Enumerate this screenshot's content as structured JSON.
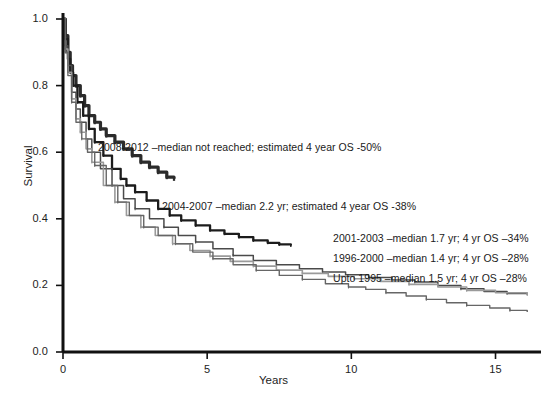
{
  "chart_data": {
    "type": "line",
    "title": "",
    "subtitle": "",
    "xlabel": "Years",
    "ylabel": "Survival",
    "xlim": [
      0,
      16.3
    ],
    "ylim": [
      0.0,
      1.0
    ],
    "xticks": [
      "0",
      "5",
      "10",
      "15"
    ],
    "xtick_values": [
      0,
      5,
      10,
      15
    ],
    "yticks": [
      "0.0",
      "0.2",
      "0.4",
      "0.6",
      "0.8",
      "1.0"
    ],
    "ytick_values": [
      0.0,
      0.2,
      0.4,
      0.6,
      0.8,
      1.0
    ],
    "grid": false,
    "legend_position": "inline-annotations",
    "series": [
      {
        "name": "2008-2012",
        "color": "#2b2b2b",
        "width": 3.2,
        "label": "2008-2012 –median not reached; estimated 4 year OS  -50%",
        "median_years": null,
        "four_year_os_percent": 50,
        "x": [
          0,
          0.08,
          0.17,
          0.25,
          0.33,
          0.45,
          0.6,
          0.75,
          0.9,
          1.1,
          1.3,
          1.5,
          1.8,
          2.1,
          2.4,
          2.7,
          3.0,
          3.3,
          3.6,
          3.85
        ],
        "y": [
          1.0,
          0.95,
          0.9,
          0.86,
          0.83,
          0.8,
          0.77,
          0.74,
          0.71,
          0.69,
          0.67,
          0.65,
          0.63,
          0.61,
          0.59,
          0.57,
          0.555,
          0.54,
          0.525,
          0.52
        ]
      },
      {
        "name": "2004-2007",
        "color": "#1c1c1c",
        "width": 2.3,
        "label": "2004-2007 –median 2.2 yr; estimated 4 year OS  -38%",
        "median_years": 2.2,
        "four_year_os_percent": 38,
        "x": [
          0,
          0.08,
          0.17,
          0.25,
          0.35,
          0.5,
          0.7,
          0.9,
          1.1,
          1.4,
          1.7,
          2.0,
          2.2,
          2.5,
          2.9,
          3.3,
          3.7,
          4.1,
          4.6,
          5.1,
          5.6,
          6.1,
          6.6,
          7.1,
          7.5,
          7.9
        ],
        "y": [
          1.0,
          0.94,
          0.88,
          0.84,
          0.8,
          0.75,
          0.71,
          0.67,
          0.63,
          0.59,
          0.55,
          0.52,
          0.5,
          0.48,
          0.455,
          0.43,
          0.41,
          0.395,
          0.38,
          0.365,
          0.355,
          0.345,
          0.335,
          0.328,
          0.323,
          0.32
        ]
      },
      {
        "name": "2001-2003",
        "color": "#4a4a4a",
        "width": 1.5,
        "label": "2001-2003 –median 1.7 yr; 4 yr OS –34%",
        "median_years": 1.7,
        "four_year_os_percent": 34,
        "x": [
          0,
          0.08,
          0.17,
          0.3,
          0.45,
          0.6,
          0.8,
          1.0,
          1.3,
          1.7,
          2.1,
          2.5,
          3.0,
          3.5,
          4.0,
          4.6,
          5.2,
          5.9,
          6.6,
          7.4,
          8.2,
          9.0,
          9.8,
          10.6,
          11.4,
          12.2,
          13.0,
          13.8,
          14.6,
          15.4,
          16.1
        ],
        "y": [
          1.0,
          0.92,
          0.86,
          0.78,
          0.73,
          0.69,
          0.64,
          0.6,
          0.55,
          0.5,
          0.46,
          0.43,
          0.4,
          0.375,
          0.35,
          0.33,
          0.31,
          0.29,
          0.275,
          0.262,
          0.25,
          0.24,
          0.232,
          0.224,
          0.216,
          0.21,
          0.2,
          0.19,
          0.182,
          0.176,
          0.172
        ]
      },
      {
        "name": "1996-2000",
        "color": "#9a9a9a",
        "width": 1.6,
        "label": "1996-2000 –median 1.4 yr; 4 yr OS –28%",
        "median_years": 1.4,
        "four_year_os_percent": 28,
        "x": [
          0,
          0.08,
          0.17,
          0.3,
          0.45,
          0.6,
          0.8,
          1.0,
          1.4,
          1.8,
          2.2,
          2.7,
          3.2,
          3.8,
          4.4,
          5.1,
          5.8,
          6.6,
          7.4,
          8.3,
          9.2,
          10.1,
          11.0,
          12.0,
          13.0,
          14.0,
          15.0,
          16.1
        ],
        "y": [
          1.0,
          0.91,
          0.84,
          0.76,
          0.7,
          0.66,
          0.61,
          0.57,
          0.5,
          0.45,
          0.41,
          0.375,
          0.35,
          0.325,
          0.305,
          0.288,
          0.272,
          0.258,
          0.246,
          0.236,
          0.227,
          0.22,
          0.212,
          0.203,
          0.195,
          0.185,
          0.178,
          0.172
        ]
      },
      {
        "name": "Upto 1995",
        "color": "#666666",
        "width": 1.4,
        "label": "Upto 1995 –median 1.5 yr; 4 yr OS –28%",
        "median_years": 1.5,
        "four_year_os_percent": 28,
        "x": [
          0,
          0.08,
          0.17,
          0.3,
          0.45,
          0.65,
          0.85,
          1.1,
          1.5,
          1.9,
          2.3,
          2.8,
          3.3,
          3.9,
          4.5,
          5.2,
          5.9,
          6.7,
          7.5,
          8.3,
          9.1,
          9.9,
          10.5,
          11.2,
          11.9,
          12.6,
          13.3,
          14.0,
          14.8,
          15.5,
          16.1
        ],
        "y": [
          1.0,
          0.9,
          0.83,
          0.75,
          0.69,
          0.64,
          0.6,
          0.56,
          0.5,
          0.45,
          0.41,
          0.375,
          0.35,
          0.325,
          0.3,
          0.28,
          0.262,
          0.245,
          0.23,
          0.218,
          0.205,
          0.195,
          0.188,
          0.178,
          0.168,
          0.158,
          0.148,
          0.14,
          0.132,
          0.125,
          0.12
        ]
      }
    ],
    "annotations": [
      {
        "text": "2008-2012 –median not reached; estimated 4 year OS  -50%",
        "x_px": 98,
        "y_px": 141
      },
      {
        "text": "2004-2007 –median 2.2 yr; estimated 4 year OS  -38%",
        "x_px": 162,
        "y_px": 200
      },
      {
        "text": "2001-2003 –median 1.7 yr; 4 yr OS –34%",
        "x_px": 333,
        "y_px": 232
      },
      {
        "text": "1996-2000 –median 1.4 yr; 4 yr OS –28%",
        "x_px": 333,
        "y_px": 252
      },
      {
        "text": "Upto 1995 –median 1.5 yr; 4 yr OS –28%",
        "x_px": 333,
        "y_px": 272
      }
    ]
  },
  "axes": {
    "y_label": "Survival",
    "x_label": "Years",
    "y_tick_labels": [
      "1.0",
      "0.8",
      "0.6",
      "0.4",
      "0.2",
      "0.0"
    ],
    "x_tick_labels": [
      "0",
      "5",
      "10",
      "15"
    ]
  }
}
